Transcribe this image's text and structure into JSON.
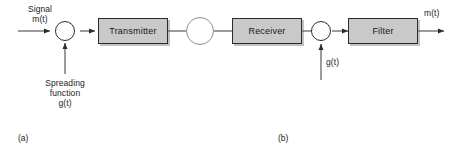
{
  "figure": {
    "title_a": "(a)",
    "title_b": "(b)",
    "input_label_line1": "Signal",
    "input_label_line2": "m(t)",
    "output_label": "m(t)",
    "spread_label_line1": "Spreading",
    "spread_label_line2": "function",
    "spread_label_line3": "g(t)",
    "despread_label": "g(t)",
    "blocks": [
      {
        "name": "transmitter",
        "label": "Transmitter"
      },
      {
        "name": "receiver",
        "label": "Receiver"
      },
      {
        "name": "filter",
        "label": "Filter"
      }
    ],
    "nodes": [
      {
        "name": "spread-multiplier",
        "symbol": "multiply-icon"
      },
      {
        "name": "channel",
        "symbol": "channel-zigzag-icon"
      },
      {
        "name": "despread-multiplier",
        "symbol": "multiply-icon"
      }
    ],
    "colors": {
      "block_fill": "#c9c9c9",
      "stroke": "#2b2b2b",
      "text": "#1a1a1a",
      "background": "#ffffff"
    }
  }
}
